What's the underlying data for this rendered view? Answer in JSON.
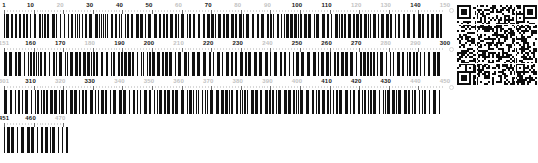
{
  "document": {
    "title": "Barcode Position Ruler",
    "kind": "linear-barcode-ruler-with-qr"
  },
  "ruler": {
    "start": 1,
    "end": 470,
    "tick_interval": 10,
    "bar_color": "#111111",
    "major_label_color": "#1a1a1a",
    "minor_label_color": "#c2c2c2",
    "rows": [
      {
        "index": 1,
        "name": "row-1",
        "range_start": 1,
        "range_end": 150,
        "full_width": true,
        "labels": [
          {
            "value": "1",
            "pos": 1,
            "emphasis": "major"
          },
          {
            "value": "10",
            "pos": 10,
            "emphasis": "major"
          },
          {
            "value": "20",
            "pos": 20,
            "emphasis": "minor"
          },
          {
            "value": "30",
            "pos": 30,
            "emphasis": "major"
          },
          {
            "value": "40",
            "pos": 40,
            "emphasis": "major"
          },
          {
            "value": "50",
            "pos": 50,
            "emphasis": "major"
          },
          {
            "value": "60",
            "pos": 60,
            "emphasis": "minor"
          },
          {
            "value": "70",
            "pos": 70,
            "emphasis": "major"
          },
          {
            "value": "80",
            "pos": 80,
            "emphasis": "minor"
          },
          {
            "value": "90",
            "pos": 90,
            "emphasis": "minor"
          },
          {
            "value": "100",
            "pos": 100,
            "emphasis": "major"
          },
          {
            "value": "110",
            "pos": 110,
            "emphasis": "major"
          },
          {
            "value": "120",
            "pos": 120,
            "emphasis": "minor"
          },
          {
            "value": "130",
            "pos": 130,
            "emphasis": "minor"
          },
          {
            "value": "140",
            "pos": 140,
            "emphasis": "major"
          },
          {
            "value": "150",
            "pos": 150,
            "emphasis": "minor"
          }
        ]
      },
      {
        "index": 2,
        "name": "row-2",
        "range_start": 151,
        "range_end": 300,
        "full_width": true,
        "labels": [
          {
            "value": "151",
            "pos": 151,
            "emphasis": "minor"
          },
          {
            "value": "160",
            "pos": 160,
            "emphasis": "major"
          },
          {
            "value": "170",
            "pos": 170,
            "emphasis": "major"
          },
          {
            "value": "180",
            "pos": 180,
            "emphasis": "minor"
          },
          {
            "value": "190",
            "pos": 190,
            "emphasis": "major"
          },
          {
            "value": "200",
            "pos": 200,
            "emphasis": "major"
          },
          {
            "value": "210",
            "pos": 210,
            "emphasis": "minor"
          },
          {
            "value": "220",
            "pos": 220,
            "emphasis": "major"
          },
          {
            "value": "230",
            "pos": 230,
            "emphasis": "major"
          },
          {
            "value": "240",
            "pos": 240,
            "emphasis": "minor"
          },
          {
            "value": "250",
            "pos": 250,
            "emphasis": "major"
          },
          {
            "value": "260",
            "pos": 260,
            "emphasis": "major"
          },
          {
            "value": "270",
            "pos": 270,
            "emphasis": "major"
          },
          {
            "value": "280",
            "pos": 280,
            "emphasis": "minor"
          },
          {
            "value": "290",
            "pos": 290,
            "emphasis": "minor"
          },
          {
            "value": "300",
            "pos": 300,
            "emphasis": "major"
          }
        ]
      },
      {
        "index": 3,
        "name": "row-3",
        "range_start": 301,
        "range_end": 450,
        "full_width": true,
        "labels": [
          {
            "value": "301",
            "pos": 301,
            "emphasis": "minor"
          },
          {
            "value": "310",
            "pos": 310,
            "emphasis": "major"
          },
          {
            "value": "320",
            "pos": 320,
            "emphasis": "minor"
          },
          {
            "value": "330",
            "pos": 330,
            "emphasis": "major"
          },
          {
            "value": "340",
            "pos": 340,
            "emphasis": "minor"
          },
          {
            "value": "350",
            "pos": 350,
            "emphasis": "minor"
          },
          {
            "value": "360",
            "pos": 360,
            "emphasis": "minor"
          },
          {
            "value": "370",
            "pos": 370,
            "emphasis": "minor"
          },
          {
            "value": "380",
            "pos": 380,
            "emphasis": "minor"
          },
          {
            "value": "390",
            "pos": 390,
            "emphasis": "minor"
          },
          {
            "value": "400",
            "pos": 400,
            "emphasis": "minor"
          },
          {
            "value": "410",
            "pos": 410,
            "emphasis": "major"
          },
          {
            "value": "420",
            "pos": 420,
            "emphasis": "major"
          },
          {
            "value": "430",
            "pos": 430,
            "emphasis": "major"
          },
          {
            "value": "440",
            "pos": 440,
            "emphasis": "minor"
          },
          {
            "value": "450",
            "pos": 450,
            "emphasis": "minor"
          }
        ]
      },
      {
        "index": 4,
        "name": "row-4",
        "range_start": 451,
        "range_end": 470,
        "full_width": false,
        "labels": [
          {
            "value": "451",
            "pos": 451,
            "emphasis": "major"
          },
          {
            "value": "460",
            "pos": 460,
            "emphasis": "major"
          },
          {
            "value": "470",
            "pos": 470,
            "emphasis": "minor"
          }
        ]
      }
    ]
  },
  "qr_code": {
    "name": "qr-code",
    "modules": 41,
    "dark_color": "#0d0d0d",
    "light_color": "#ffffff"
  }
}
